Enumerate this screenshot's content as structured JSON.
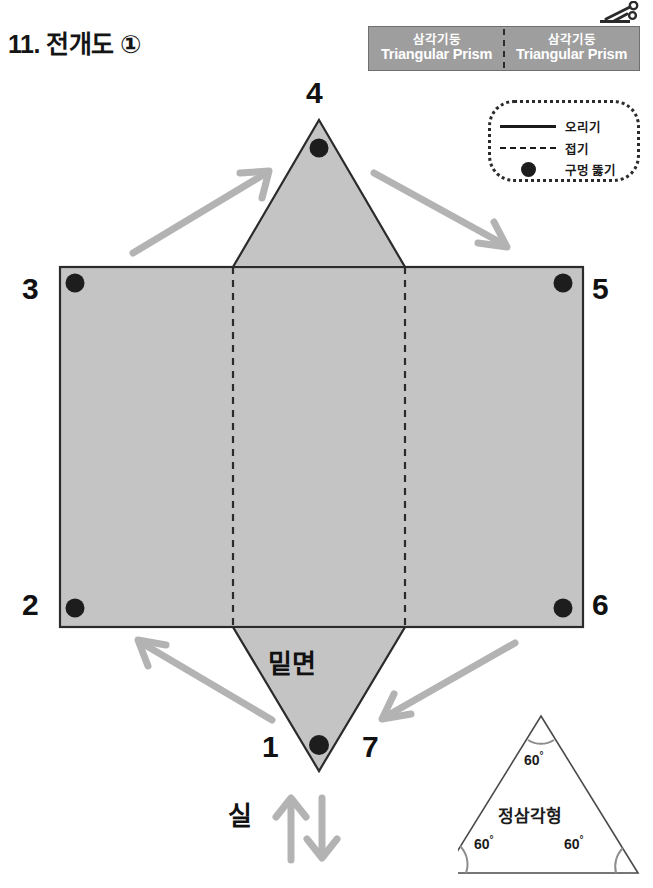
{
  "page": {
    "title": "11. 전개도 ①"
  },
  "header": {
    "cells": [
      {
        "kr": "삼각기둥",
        "en": "Triangular Prism"
      },
      {
        "kr": "삼각기둥",
        "en": "Triangular Prism"
      }
    ],
    "scissors_icon": "scissors-icon"
  },
  "legend": {
    "rows": [
      {
        "symbol": "solid-line",
        "label": "오리기"
      },
      {
        "symbol": "dashed-line",
        "label": "접기"
      },
      {
        "symbol": "filled-dot",
        "label": "구멍 뚫기"
      }
    ]
  },
  "net": {
    "numbers": {
      "top": "4",
      "top_left": "3",
      "top_right": "5",
      "bottom_left": "2",
      "bottom_right": "6",
      "bottom_tip_left": "1",
      "bottom_tip_right": "7"
    },
    "bottom_face_label": "밑면",
    "thread_label": "실",
    "fill_color": "#c4c4c4",
    "stroke_color": "#2b2b2b",
    "hole_color": "#1d1d1d",
    "arrow_color": "#b3b3b3",
    "holes": 7
  },
  "triangle_panel": {
    "name": "정삼각형",
    "angles": [
      "60",
      "60",
      "60"
    ],
    "degree_symbol": "°"
  }
}
